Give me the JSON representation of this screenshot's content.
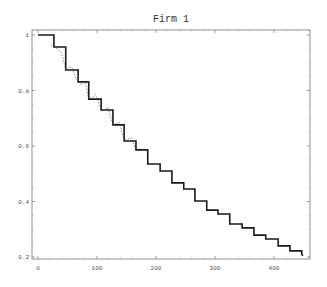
{
  "chart_data": {
    "type": "line",
    "subtype": "step",
    "title": "Firm 1",
    "xlabel": "",
    "ylabel": "",
    "xlim": [
      -10,
      460
    ],
    "ylim": [
      0.19,
      1.02
    ],
    "x_ticks": [
      0,
      100,
      200,
      300,
      400
    ],
    "y_ticks": [
      0.2,
      0.4,
      0.6,
      0.8,
      1
    ],
    "x_tick_labels": [
      "0",
      "100",
      "200",
      "300",
      "400"
    ],
    "y_tick_labels": [
      "0.2",
      "0.4",
      "0.6",
      "0.8",
      "1"
    ],
    "grid": false,
    "legend": null,
    "series": [
      {
        "name": "step estimate",
        "style": "solid-thick",
        "color": "#1a1a1a",
        "x": [
          0,
          27,
          47,
          68,
          86,
          107,
          127,
          146,
          166,
          186,
          207,
          227,
          247,
          266,
          286,
          305,
          325,
          346,
          366,
          386,
          407,
          427,
          447
        ],
        "y": [
          1.0,
          0.957,
          0.874,
          0.831,
          0.769,
          0.73,
          0.676,
          0.618,
          0.586,
          0.535,
          0.51,
          0.467,
          0.445,
          0.402,
          0.369,
          0.355,
          0.319,
          0.305,
          0.279,
          0.265,
          0.24,
          0.222,
          0.211
        ]
      },
      {
        "name": "empirical",
        "style": "dashed-thin",
        "color": "#444444",
        "x": [
          22,
          27,
          33,
          40,
          47,
          52,
          58,
          64,
          68,
          74,
          80,
          86,
          92,
          98,
          107,
          112,
          118,
          127,
          132,
          138,
          146,
          152,
          158,
          166
        ],
        "y": [
          0.965,
          0.957,
          0.95,
          0.935,
          0.874,
          0.885,
          0.88,
          0.845,
          0.831,
          0.82,
          0.835,
          0.769,
          0.775,
          0.785,
          0.73,
          0.725,
          0.74,
          0.676,
          0.68,
          0.685,
          0.618,
          0.625,
          0.63,
          0.586
        ]
      }
    ]
  }
}
